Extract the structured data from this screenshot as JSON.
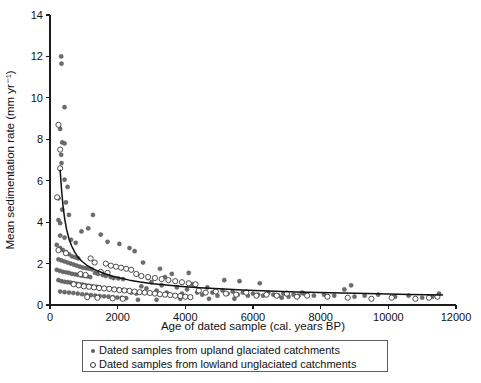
{
  "chart_data": {
    "type": "scatter",
    "title": "",
    "xlabel": "Age of dated sample (cal. years BP)",
    "ylabel": "Mean sedimentation rate (mm yr⁻¹)",
    "xlim": [
      0,
      12000
    ],
    "ylim": [
      0,
      14
    ],
    "xticks": [
      0,
      2000,
      4000,
      6000,
      8000,
      10000,
      12000
    ],
    "xtick_labels": [
      "0",
      "2000",
      "4000",
      "6000",
      "8000",
      "10000",
      "12000"
    ],
    "yticks": [
      0,
      2,
      4,
      6,
      8,
      10,
      12,
      14
    ],
    "ytick_labels": [
      "0",
      "2",
      "4",
      "6",
      "8",
      "10",
      "12",
      "14"
    ],
    "grid": false,
    "legend_position": "below-axes",
    "legend_entries": [
      {
        "marker": "filled-circle",
        "label": "Dated samples from upland glaciated catchments"
      },
      {
        "marker": "open-circle",
        "label": "Dated samples from lowland unglaciated catchments"
      }
    ],
    "series": [
      {
        "name": "Dated samples from upland glaciated catchments",
        "marker": "filled-circle",
        "color": "#6d6d6d",
        "points": [
          [
            330,
            12.0
          ],
          [
            340,
            11.65
          ],
          [
            430,
            9.55
          ],
          [
            300,
            8.5
          ],
          [
            360,
            7.85
          ],
          [
            430,
            7.8
          ],
          [
            330,
            7.25
          ],
          [
            340,
            6.85
          ],
          [
            430,
            6.05
          ],
          [
            520,
            5.7
          ],
          [
            250,
            5.15
          ],
          [
            470,
            4.95
          ],
          [
            360,
            4.6
          ],
          [
            560,
            4.35
          ],
          [
            250,
            4.1
          ],
          [
            300,
            3.95
          ],
          [
            1270,
            4.35
          ],
          [
            1130,
            3.7
          ],
          [
            930,
            3.55
          ],
          [
            1500,
            3.4
          ],
          [
            300,
            3.35
          ],
          [
            430,
            3.25
          ],
          [
            620,
            3.15
          ],
          [
            760,
            3.0
          ],
          [
            1700,
            3.05
          ],
          [
            2050,
            2.95
          ],
          [
            2350,
            2.75
          ],
          [
            2500,
            2.6
          ],
          [
            200,
            2.9
          ],
          [
            300,
            2.75
          ],
          [
            380,
            2.65
          ],
          [
            470,
            2.55
          ],
          [
            560,
            2.45
          ],
          [
            650,
            2.35
          ],
          [
            740,
            2.3
          ],
          [
            830,
            2.25
          ],
          [
            250,
            2.2
          ],
          [
            340,
            2.15
          ],
          [
            430,
            2.1
          ],
          [
            520,
            2.05
          ],
          [
            610,
            2.0
          ],
          [
            700,
            1.95
          ],
          [
            790,
            1.9
          ],
          [
            880,
            1.85
          ],
          [
            970,
            1.8
          ],
          [
            1060,
            1.78
          ],
          [
            1150,
            1.75
          ],
          [
            1240,
            1.72
          ],
          [
            200,
            1.7
          ],
          [
            290,
            1.65
          ],
          [
            380,
            1.6
          ],
          [
            470,
            1.58
          ],
          [
            560,
            1.55
          ],
          [
            650,
            1.5
          ],
          [
            740,
            1.48
          ],
          [
            830,
            1.45
          ],
          [
            920,
            1.42
          ],
          [
            1010,
            1.4
          ],
          [
            1100,
            1.38
          ],
          [
            1190,
            1.35
          ],
          [
            1330,
            1.55
          ],
          [
            1420,
            1.5
          ],
          [
            1560,
            1.45
          ],
          [
            1650,
            1.4
          ],
          [
            1790,
            1.35
          ],
          [
            1880,
            1.3
          ],
          [
            2020,
            1.28
          ],
          [
            2160,
            1.25
          ],
          [
            250,
            1.2
          ],
          [
            340,
            1.15
          ],
          [
            430,
            1.12
          ],
          [
            520,
            1.1
          ],
          [
            610,
            1.08
          ],
          [
            700,
            1.05
          ],
          [
            790,
            1.02
          ],
          [
            880,
            1.0
          ],
          [
            970,
            0.98
          ],
          [
            1060,
            0.95
          ],
          [
            1150,
            0.92
          ],
          [
            1240,
            0.9
          ],
          [
            1380,
            0.88
          ],
          [
            1470,
            0.85
          ],
          [
            1610,
            0.82
          ],
          [
            1750,
            0.8
          ],
          [
            1890,
            0.78
          ],
          [
            2030,
            0.75
          ],
          [
            2170,
            0.73
          ],
          [
            2310,
            0.7
          ],
          [
            300,
            0.65
          ],
          [
            430,
            0.62
          ],
          [
            560,
            0.6
          ],
          [
            690,
            0.58
          ],
          [
            820,
            0.55
          ],
          [
            950,
            0.52
          ],
          [
            1080,
            0.5
          ],
          [
            1210,
            0.48
          ],
          [
            1340,
            0.45
          ],
          [
            1470,
            0.43
          ],
          [
            1600,
            0.42
          ],
          [
            1730,
            0.4
          ],
          [
            1860,
            0.38
          ],
          [
            1990,
            0.36
          ],
          [
            2120,
            0.35
          ],
          [
            2250,
            0.33
          ],
          [
            2400,
            0.6
          ],
          [
            2550,
            0.55
          ],
          [
            2700,
            0.9
          ],
          [
            2850,
            0.8
          ],
          [
            3000,
            1.1
          ],
          [
            3150,
            0.7
          ],
          [
            3300,
            0.95
          ],
          [
            3450,
            0.6
          ],
          [
            3600,
            1.5
          ],
          [
            3750,
            0.85
          ],
          [
            3900,
            0.55
          ],
          [
            4050,
            0.75
          ],
          [
            4200,
            1.0
          ],
          [
            4350,
            0.6
          ],
          [
            4500,
            0.5
          ],
          [
            4650,
            0.85
          ],
          [
            4800,
            0.6
          ],
          [
            4950,
            0.45
          ],
          [
            5100,
            0.7
          ],
          [
            5250,
            0.55
          ],
          [
            5400,
            0.65
          ],
          [
            5550,
            0.5
          ],
          [
            5700,
            0.6
          ],
          [
            5850,
            0.45
          ],
          [
            6000,
            0.55
          ],
          [
            6150,
            0.5
          ],
          [
            6300,
            0.45
          ],
          [
            6450,
            0.6
          ],
          [
            6600,
            0.5
          ],
          [
            6750,
            0.45
          ],
          [
            6900,
            0.55
          ],
          [
            7050,
            0.4
          ],
          [
            7200,
            0.5
          ],
          [
            7350,
            0.45
          ],
          [
            7500,
            0.55
          ],
          [
            7800,
            0.45
          ],
          [
            8100,
            0.5
          ],
          [
            8400,
            0.45
          ],
          [
            8700,
            0.75
          ],
          [
            9000,
            0.4
          ],
          [
            9300,
            0.45
          ],
          [
            9700,
            0.5
          ],
          [
            10200,
            0.4
          ],
          [
            10600,
            0.45
          ],
          [
            11000,
            0.35
          ],
          [
            11300,
            0.4
          ],
          [
            11500,
            0.55
          ],
          [
            4100,
            1.55
          ],
          [
            5150,
            1.2
          ],
          [
            5600,
            1.15
          ],
          [
            6200,
            1.05
          ],
          [
            2750,
            2.05
          ],
          [
            3250,
            1.75
          ],
          [
            2900,
            1.3
          ],
          [
            3400,
            1.35
          ],
          [
            8900,
            0.95
          ],
          [
            7450,
            0.6
          ],
          [
            6850,
            0.35
          ],
          [
            5450,
            0.3
          ],
          [
            4700,
            0.3
          ],
          [
            3850,
            0.3
          ],
          [
            3150,
            0.25
          ],
          [
            2600,
            0.25
          ]
        ]
      },
      {
        "name": "Dated samples from lowland unglaciated catchments",
        "marker": "open-circle",
        "color": "#ffffff",
        "points": [
          [
            250,
            8.7
          ],
          [
            300,
            7.5
          ],
          [
            300,
            6.6
          ],
          [
            210,
            5.2
          ],
          [
            250,
            2.65
          ],
          [
            470,
            2.5
          ],
          [
            1200,
            2.25
          ],
          [
            1320,
            2.05
          ],
          [
            1650,
            2.0
          ],
          [
            1800,
            1.9
          ],
          [
            1950,
            1.85
          ],
          [
            2100,
            1.8
          ],
          [
            2250,
            1.75
          ],
          [
            2400,
            1.7
          ],
          [
            1500,
            1.6
          ],
          [
            1700,
            1.55
          ],
          [
            900,
            1.5
          ],
          [
            1050,
            1.45
          ],
          [
            2550,
            1.5
          ],
          [
            2700,
            1.4
          ],
          [
            2900,
            1.35
          ],
          [
            3100,
            1.3
          ],
          [
            3300,
            1.25
          ],
          [
            3500,
            1.2
          ],
          [
            3700,
            1.15
          ],
          [
            3900,
            1.1
          ],
          [
            4100,
            1.05
          ],
          [
            4300,
            1.0
          ],
          [
            700,
            1.0
          ],
          [
            850,
            0.95
          ],
          [
            1000,
            0.9
          ],
          [
            1150,
            0.88
          ],
          [
            1300,
            0.85
          ],
          [
            1450,
            0.82
          ],
          [
            1600,
            0.8
          ],
          [
            1750,
            0.78
          ],
          [
            1900,
            0.75
          ],
          [
            2050,
            0.72
          ],
          [
            2200,
            0.7
          ],
          [
            2350,
            0.68
          ],
          [
            2500,
            0.65
          ],
          [
            2650,
            0.62
          ],
          [
            2800,
            0.6
          ],
          [
            2950,
            0.58
          ],
          [
            3100,
            0.55
          ],
          [
            3250,
            0.52
          ],
          [
            3400,
            0.5
          ],
          [
            3550,
            0.48
          ],
          [
            3700,
            0.45
          ],
          [
            3850,
            0.43
          ],
          [
            4000,
            0.4
          ],
          [
            4150,
            0.38
          ],
          [
            4400,
            0.7
          ],
          [
            4600,
            0.6
          ],
          [
            4900,
            0.65
          ],
          [
            5200,
            0.55
          ],
          [
            5500,
            0.5
          ],
          [
            5800,
            0.6
          ],
          [
            6100,
            0.45
          ],
          [
            6400,
            0.5
          ],
          [
            6700,
            0.45
          ],
          [
            7000,
            0.55
          ],
          [
            7300,
            0.4
          ],
          [
            7600,
            0.45
          ],
          [
            8200,
            0.4
          ],
          [
            8800,
            0.35
          ],
          [
            9500,
            0.3
          ],
          [
            10100,
            0.35
          ],
          [
            10800,
            0.3
          ],
          [
            11200,
            0.35
          ],
          [
            11450,
            0.4
          ],
          [
            2150,
            0.3
          ],
          [
            1850,
            0.32
          ],
          [
            1400,
            0.35
          ],
          [
            1100,
            0.38
          ]
        ]
      }
    ],
    "fit_curve": {
      "label": "power-law trend",
      "color": "#111111",
      "points": [
        [
          300,
          6.5
        ],
        [
          340,
          5.6
        ],
        [
          380,
          4.85
        ],
        [
          430,
          4.2
        ],
        [
          490,
          3.65
        ],
        [
          560,
          3.2
        ],
        [
          640,
          2.85
        ],
        [
          730,
          2.55
        ],
        [
          830,
          2.3
        ],
        [
          950,
          2.1
        ],
        [
          1080,
          1.93
        ],
        [
          1230,
          1.78
        ],
        [
          1400,
          1.65
        ],
        [
          1600,
          1.52
        ],
        [
          1820,
          1.4
        ],
        [
          2070,
          1.3
        ],
        [
          2350,
          1.2
        ],
        [
          2670,
          1.11
        ],
        [
          3030,
          1.03
        ],
        [
          3440,
          0.96
        ],
        [
          3900,
          0.89
        ],
        [
          4420,
          0.83
        ],
        [
          5010,
          0.78
        ],
        [
          5680,
          0.73
        ],
        [
          6440,
          0.68
        ],
        [
          7300,
          0.63
        ],
        [
          8270,
          0.59
        ],
        [
          9380,
          0.55
        ],
        [
          10630,
          0.51
        ],
        [
          11600,
          0.48
        ]
      ]
    }
  }
}
